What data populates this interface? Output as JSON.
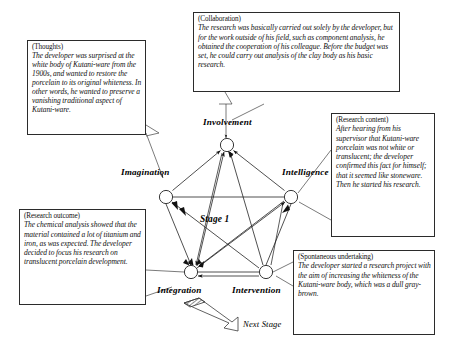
{
  "diagram": {
    "title": "Stage 1",
    "next_stage_label": "Next Stage",
    "nodes": [
      {
        "id": "involvement",
        "label": "Involvement",
        "x": 227,
        "y": 145
      },
      {
        "id": "imagination",
        "label": "Imagination",
        "x": 166,
        "y": 197
      },
      {
        "id": "intelligence",
        "label": "Intelligence",
        "x": 291,
        "y": 197
      },
      {
        "id": "integration",
        "label": "Integration",
        "x": 191,
        "y": 272
      },
      {
        "id": "intervention",
        "label": "Intervention",
        "x": 266,
        "y": 272
      }
    ],
    "edges": [
      {
        "from": "imagination",
        "to": "involvement",
        "arrow": "to"
      },
      {
        "from": "intelligence",
        "to": "involvement",
        "arrow": "to"
      },
      {
        "from": "integration",
        "to": "involvement",
        "arrow": "to"
      },
      {
        "from": "intervention",
        "to": "involvement",
        "arrow": "to"
      },
      {
        "from": "involvement",
        "to": "imagination",
        "arrow": "none"
      },
      {
        "from": "intelligence",
        "to": "imagination",
        "arrow": "to"
      },
      {
        "from": "intervention",
        "to": "imagination",
        "arrow": "to"
      },
      {
        "from": "imagination",
        "to": "integration",
        "arrow": "to"
      },
      {
        "from": "involvement",
        "to": "integration",
        "arrow": "to"
      },
      {
        "from": "intelligence",
        "to": "integration",
        "arrow": "to"
      },
      {
        "from": "intervention",
        "to": "integration",
        "arrow": "to"
      },
      {
        "from": "integration",
        "to": "intelligence",
        "arrow": "to"
      },
      {
        "from": "intervention",
        "to": "intelligence",
        "arrow": "to"
      },
      {
        "from": "intervention",
        "to": "intelligence",
        "arrow": "none"
      }
    ]
  },
  "callouts": {
    "thoughts": {
      "caption": "(Thoughts)",
      "text": "The developer was surprised at the white body of Kutani-ware from the 1900s, and wanted to restore the porcelain to its original whiteness. In other words, he wanted to preserve a vanishing traditional aspect of Kutani-ware."
    },
    "collaboration": {
      "caption": "(Collaboration)",
      "text": "The research was basically carried out solely by the developer, but for the work outside of his field, such as component analysis, he obtained the cooperation of his colleague. Before the budget was set, he could carry out analysis of the clay body as his basic research."
    },
    "research_content": {
      "caption": "(Research content)",
      "text": "After hearing from his supervisor that Kutani-ware porcelain was not white or translucent; the developer confirmed this fact for himself; that it seemed like stoneware. Then he started his research."
    },
    "research_outcome": {
      "caption": "(Research outcome)",
      "text": "The chemical analysis showed that the material contained a lot of titanium and iron, as was expected. The developer decided to focus his research on translucent porcelain development."
    },
    "spontaneous_undertaking": {
      "caption": "(Spontaneous undertaking)",
      "text": "The developer started a research project with the aim of increasing the whiteness of the Kutani-ware body, which was a dull gray-brown."
    }
  },
  "colors": {
    "ink": "#101010",
    "border": "#2b2b2b",
    "background": "#ffffff"
  }
}
